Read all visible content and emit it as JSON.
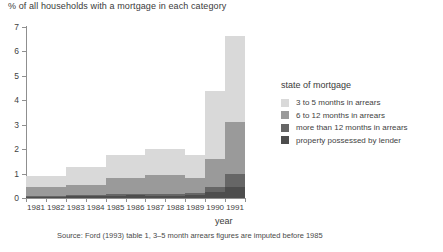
{
  "chart_data": {
    "type": "area",
    "title": "% of all households with a mortgage in each category",
    "xlabel": "year",
    "ylabel": "",
    "ylim": [
      0,
      7
    ],
    "yticks": [
      0,
      1,
      2,
      3,
      4,
      5,
      6,
      7
    ],
    "grid": false,
    "categories": [
      "1981",
      "1982",
      "1983",
      "1984",
      "1985",
      "1986",
      "1987",
      "1988",
      "1989",
      "1990",
      "1991"
    ],
    "legend_title": "state of mortgage",
    "legend_position": "right",
    "series": [
      {
        "name": "property possessed by lender",
        "color": "#4d4d4d",
        "values": [
          0.05,
          0.05,
          0.08,
          0.08,
          0.1,
          0.12,
          0.1,
          0.09,
          0.12,
          0.25,
          0.45
        ]
      },
      {
        "name": "more than 12 months in arrears",
        "color": "#666666",
        "values": [
          0.04,
          0.04,
          0.05,
          0.05,
          0.06,
          0.06,
          0.06,
          0.06,
          0.08,
          0.18,
          0.55
        ]
      },
      {
        "name": "6 to 12 months in arrears",
        "color": "#9a9a9a",
        "values": [
          0.36,
          0.36,
          0.42,
          0.42,
          0.64,
          0.64,
          0.79,
          0.79,
          0.6,
          1.17,
          2.1
        ]
      },
      {
        "name": "3 to 5 months in arrears",
        "color": "#d9d9d9",
        "values": [
          0.45,
          0.45,
          0.7,
          0.7,
          0.95,
          0.95,
          1.05,
          1.06,
          0.95,
          2.8,
          3.55
        ]
      }
    ],
    "totals": [
      0.9,
      0.9,
      1.25,
      1.25,
      1.75,
      1.77,
      2.0,
      2.0,
      1.75,
      4.4,
      6.65
    ],
    "source": "Source: Ford (1993) table 1, 3–5 month arrears figures are imputed before 1985"
  }
}
